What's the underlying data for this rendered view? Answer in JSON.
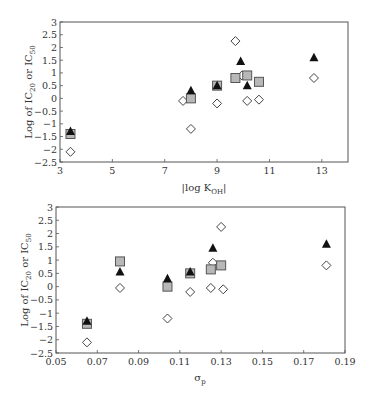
{
  "chart_data": [
    {
      "type": "scatter",
      "title": "",
      "xlabel": "|log K_OH|",
      "ylabel": "Log of IC20 or IC50",
      "xlim": [
        3,
        14
      ],
      "ylim": [
        -2.5,
        3
      ],
      "xticks": [
        3,
        5,
        7,
        9,
        11,
        13
      ],
      "yticks": [
        -2.5,
        -2,
        -1.5,
        -1,
        -0.5,
        0,
        0.5,
        1,
        1.5,
        2,
        2.5,
        3
      ],
      "grid": false,
      "legend": null,
      "series": [
        {
          "name": "triangle (filled black)",
          "marker": "triangle",
          "points": [
            [
              3.4,
              -1.3
            ],
            [
              8.0,
              0.3
            ],
            [
              9.0,
              0.5
            ],
            [
              9.9,
              1.45
            ],
            [
              10.15,
              0.5
            ],
            [
              12.7,
              1.6
            ]
          ]
        },
        {
          "name": "square (gray)",
          "marker": "square",
          "points": [
            [
              3.4,
              -1.4
            ],
            [
              8.0,
              0.0
            ],
            [
              9.0,
              0.5
            ],
            [
              9.7,
              0.8
            ],
            [
              10.15,
              0.9
            ],
            [
              10.6,
              0.65
            ]
          ]
        },
        {
          "name": "diamond (open)",
          "marker": "diamond",
          "points": [
            [
              3.4,
              -2.1
            ],
            [
              7.7,
              -0.1
            ],
            [
              8.0,
              -1.2
            ],
            [
              9.0,
              -0.2
            ],
            [
              9.7,
              2.25
            ],
            [
              9.95,
              0.9
            ],
            [
              10.15,
              -0.1
            ],
            [
              10.6,
              -0.05
            ],
            [
              12.7,
              0.8
            ]
          ]
        }
      ]
    },
    {
      "type": "scatter",
      "title": "",
      "xlabel": "σp",
      "ylabel": "Log of IC20 or IC50",
      "xlim": [
        0.05,
        0.19
      ],
      "ylim": [
        -2.5,
        3
      ],
      "xticks": [
        0.05,
        0.07,
        0.09,
        0.11,
        0.13,
        0.15,
        0.17,
        0.19
      ],
      "yticks": [
        -2.5,
        -2,
        -1.5,
        -1,
        -0.5,
        0,
        0.5,
        1,
        1.5,
        2,
        2.5,
        3
      ],
      "grid": false,
      "legend": null,
      "series": [
        {
          "name": "triangle (filled black)",
          "marker": "triangle",
          "points": [
            [
              0.065,
              -1.3
            ],
            [
              0.081,
              0.55
            ],
            [
              0.104,
              0.3
            ],
            [
              0.115,
              0.55
            ],
            [
              0.126,
              1.45
            ],
            [
              0.181,
              1.6
            ]
          ]
        },
        {
          "name": "square (gray)",
          "marker": "square",
          "points": [
            [
              0.065,
              -1.4
            ],
            [
              0.081,
              0.95
            ],
            [
              0.104,
              0.0
            ],
            [
              0.115,
              0.5
            ],
            [
              0.125,
              0.65
            ],
            [
              0.13,
              0.8
            ]
          ]
        },
        {
          "name": "diamond (open)",
          "marker": "diamond",
          "points": [
            [
              0.065,
              -2.1
            ],
            [
              0.081,
              -0.05
            ],
            [
              0.104,
              -1.2
            ],
            [
              0.115,
              -0.2
            ],
            [
              0.125,
              -0.05
            ],
            [
              0.126,
              0.9
            ],
            [
              0.13,
              2.25
            ],
            [
              0.131,
              -0.1
            ],
            [
              0.181,
              0.8
            ]
          ]
        }
      ]
    }
  ],
  "charts_text": {
    "top": {
      "ylabel_main": "Log of IC",
      "ylabel_sub1": "20",
      "ylabel_mid": " or IC",
      "ylabel_sub2": "50",
      "xlabel_main": "|log K",
      "xlabel_sub": "OH",
      "xlabel_end": "|"
    },
    "bottom": {
      "ylabel_main": "Log of IC",
      "ylabel_sub1": "20",
      "ylabel_mid": " or IC",
      "ylabel_sub2": "50",
      "xlabel_main": "σ",
      "xlabel_sub": "p"
    }
  },
  "colors": {
    "triangle": "#111111",
    "square_fill": "#b8b8b8",
    "square_stroke": "#555555",
    "diamond_stroke": "#444444",
    "axis": "#555555"
  }
}
